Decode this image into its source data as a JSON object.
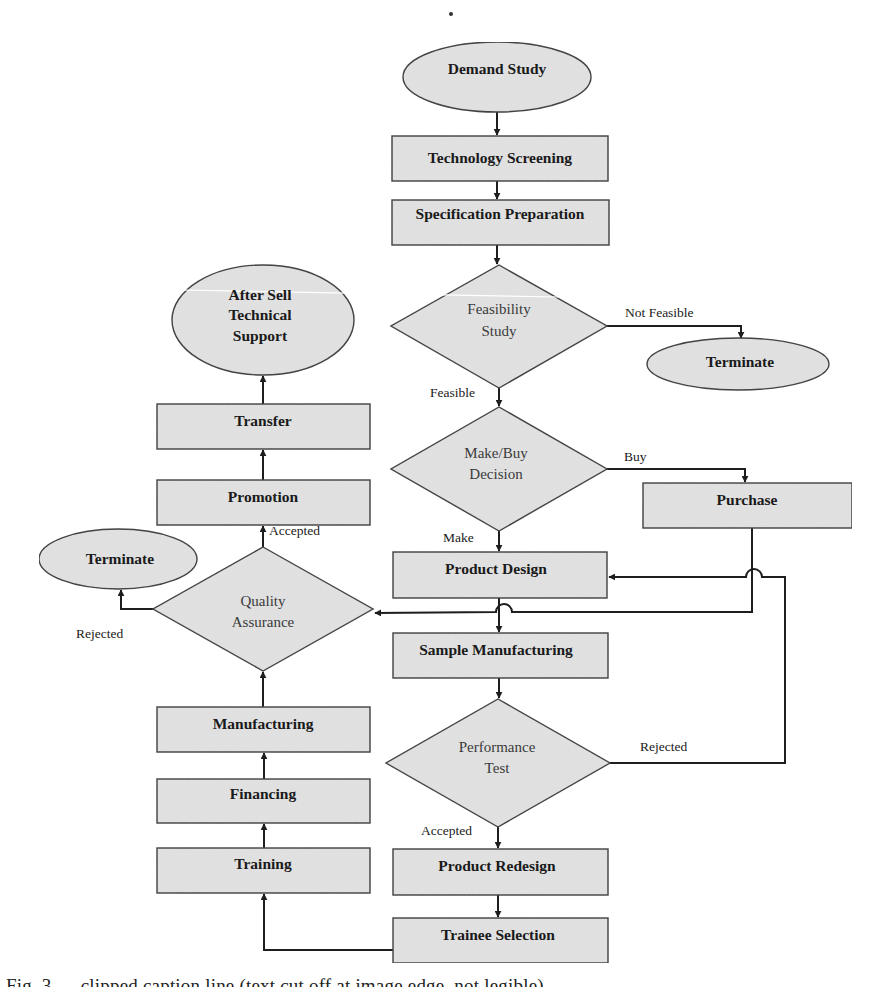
{
  "diagram": {
    "type": "flowchart",
    "colors": {
      "fill": "#e2e2e2",
      "stroke": "#3a3a3a",
      "edge": "#1e1e1e",
      "text": "#1a1a1a",
      "background": "#ffffff"
    },
    "nodes": {
      "demand_study": {
        "label": "Demand Study",
        "shape": "ellipse"
      },
      "technology_screening": {
        "label": "Technology Screening",
        "shape": "rect"
      },
      "specification_preparation": {
        "label": "Specification Preparation",
        "shape": "rect"
      },
      "feasibility_study": {
        "label_line1": "Feasibility",
        "label_line2": "Study",
        "shape": "diamond"
      },
      "terminate_right": {
        "label": "Terminate",
        "shape": "ellipse"
      },
      "make_buy_decision": {
        "label_line1": "Make/Buy",
        "label_line2": "Decision",
        "shape": "diamond"
      },
      "purchase": {
        "label": "Purchase",
        "shape": "rect"
      },
      "product_design": {
        "label": "Product Design",
        "shape": "rect"
      },
      "sample_manufacturing": {
        "label": "Sample Manufacturing",
        "shape": "rect"
      },
      "performance_test": {
        "label_line1": "Performance",
        "label_line2": "Test",
        "shape": "diamond"
      },
      "product_redesign": {
        "label": "Product Redesign",
        "shape": "rect"
      },
      "trainee_selection": {
        "label": "Trainee Selection",
        "shape": "rect"
      },
      "training": {
        "label": "Training",
        "shape": "rect"
      },
      "financing": {
        "label": "Financing",
        "shape": "rect"
      },
      "manufacturing": {
        "label": "Manufacturing",
        "shape": "rect"
      },
      "quality_assurance": {
        "label_line1": "Quality",
        "label_line2": "Assurance",
        "shape": "diamond"
      },
      "terminate_left": {
        "label": "Terminate",
        "shape": "ellipse"
      },
      "promotion": {
        "label": "Promotion",
        "shape": "rect"
      },
      "transfer": {
        "label": "Transfer",
        "shape": "rect"
      },
      "after_sell_support": {
        "label_line1": "After Sell",
        "label_line2": "Technical",
        "label_line3": "Support",
        "shape": "ellipse"
      }
    },
    "edge_labels": {
      "not_feasible": "Not Feasible",
      "feasible": "Feasible",
      "buy": "Buy",
      "make": "Make",
      "perf_rejected": "Rejected",
      "perf_accepted": "Accepted",
      "qa_rejected": "Rejected",
      "qa_accepted": "Accepted"
    },
    "edges": [
      {
        "from": "Demand Study",
        "to": "Technology Screening"
      },
      {
        "from": "Technology Screening",
        "to": "Specification Preparation"
      },
      {
        "from": "Specification Preparation",
        "to": "Feasibility Study"
      },
      {
        "from": "Feasibility Study",
        "to": "Terminate",
        "label": "Not Feasible"
      },
      {
        "from": "Feasibility Study",
        "to": "Make/Buy Decision",
        "label": "Feasible"
      },
      {
        "from": "Make/Buy Decision",
        "to": "Purchase",
        "label": "Buy"
      },
      {
        "from": "Make/Buy Decision",
        "to": "Product Design",
        "label": "Make"
      },
      {
        "from": "Purchase",
        "to": "Quality Assurance"
      },
      {
        "from": "Product Design",
        "to": "Sample Manufacturing"
      },
      {
        "from": "Sample Manufacturing",
        "to": "Performance Test"
      },
      {
        "from": "Performance Test",
        "to": "Product Design",
        "label": "Rejected"
      },
      {
        "from": "Performance Test",
        "to": "Product Redesign",
        "label": "Accepted"
      },
      {
        "from": "Product Redesign",
        "to": "Trainee Selection"
      },
      {
        "from": "Trainee Selection",
        "to": "Training"
      },
      {
        "from": "Training",
        "to": "Financing"
      },
      {
        "from": "Financing",
        "to": "Manufacturing"
      },
      {
        "from": "Manufacturing",
        "to": "Quality Assurance"
      },
      {
        "from": "Quality Assurance",
        "to": "Terminate",
        "label": "Rejected"
      },
      {
        "from": "Quality Assurance",
        "to": "Promotion",
        "label": "Accepted"
      },
      {
        "from": "Promotion",
        "to": "Transfer"
      },
      {
        "from": "Transfer",
        "to": "After Sell Technical Support"
      }
    ]
  },
  "caption": {
    "text": "Fig. 3 — clipped caption line (text cut off at image edge, not legible)"
  }
}
